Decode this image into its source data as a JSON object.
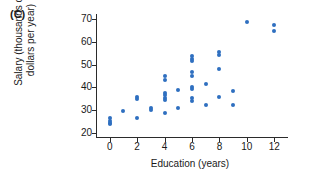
{
  "panel": {
    "label": "(C)"
  },
  "axes": {
    "xlabel": "Education (years)",
    "ylabel_line1": "Salary (thousands of",
    "ylabel_line2": "dollars per year)",
    "xticks": [
      "0",
      "2",
      "4",
      "6",
      "8",
      "10",
      "12"
    ],
    "yticks": [
      "70",
      "60",
      "50",
      "40",
      "30",
      "20"
    ]
  },
  "chart_data": {
    "type": "scatter",
    "title": "(C)",
    "xlabel": "Education (years)",
    "ylabel": "Salary (thousands of dollars per year)",
    "xlim": [
      -1,
      13
    ],
    "ylim": [
      18,
      72
    ],
    "xticks": [
      0,
      2,
      4,
      6,
      8,
      10,
      12
    ],
    "yticks": [
      20,
      30,
      40,
      50,
      60,
      70
    ],
    "grid": false,
    "legend": null,
    "marker_color": "#2f6fc0",
    "points": [
      {
        "x": 0,
        "y": 26.8
      },
      {
        "x": 0,
        "y": 25.4
      },
      {
        "x": 0,
        "y": 24.6
      },
      {
        "x": 0,
        "y": 24.0
      },
      {
        "x": 1,
        "y": 29.6
      },
      {
        "x": 2,
        "y": 35.8
      },
      {
        "x": 2,
        "y": 35.0
      },
      {
        "x": 2,
        "y": 26.6
      },
      {
        "x": 3,
        "y": 31.2
      },
      {
        "x": 3,
        "y": 30.0
      },
      {
        "x": 4,
        "y": 44.8
      },
      {
        "x": 4,
        "y": 43.4
      },
      {
        "x": 4,
        "y": 37.4
      },
      {
        "x": 4,
        "y": 36.6
      },
      {
        "x": 4,
        "y": 35.6
      },
      {
        "x": 4,
        "y": 34.6
      },
      {
        "x": 4,
        "y": 28.8
      },
      {
        "x": 5,
        "y": 38.8
      },
      {
        "x": 5,
        "y": 31.2
      },
      {
        "x": 6,
        "y": 53.6
      },
      {
        "x": 6,
        "y": 52.4
      },
      {
        "x": 6,
        "y": 51.4
      },
      {
        "x": 6,
        "y": 46.6
      },
      {
        "x": 6,
        "y": 45.2
      },
      {
        "x": 6,
        "y": 40.2
      },
      {
        "x": 6,
        "y": 39.2
      },
      {
        "x": 6,
        "y": 35.4
      },
      {
        "x": 6,
        "y": 34.2
      },
      {
        "x": 7,
        "y": 41.4
      },
      {
        "x": 7,
        "y": 32.4
      },
      {
        "x": 8,
        "y": 55.4
      },
      {
        "x": 8,
        "y": 54.2
      },
      {
        "x": 8,
        "y": 48.2
      },
      {
        "x": 8,
        "y": 36.0
      },
      {
        "x": 9,
        "y": 38.6
      },
      {
        "x": 9,
        "y": 32.4
      },
      {
        "x": 10,
        "y": 68.4
      },
      {
        "x": 12,
        "y": 67.4
      },
      {
        "x": 12,
        "y": 64.6
      }
    ]
  }
}
